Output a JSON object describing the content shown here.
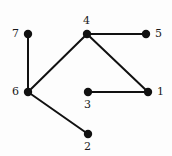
{
  "figure": {
    "kind": "undirected-graph-drawing",
    "width": 172,
    "height": 156,
    "background_color": "#fdfdfd",
    "edge_color": "#111111",
    "node_color": "#111111",
    "label_color": "#1a1a1a",
    "edge_width": 2,
    "node_radius": 4.2
  },
  "nodes": [
    {
      "id": "1",
      "label": "1",
      "x": 148,
      "y": 92,
      "label_x": 157,
      "label_y": 86,
      "label_anchor": "right"
    },
    {
      "id": "2",
      "label": "2",
      "x": 88,
      "y": 134,
      "label_x": 84,
      "label_y": 141,
      "label_anchor": "below"
    },
    {
      "id": "3",
      "label": "3",
      "x": 88,
      "y": 92,
      "label_x": 84,
      "label_y": 99,
      "label_anchor": "below"
    },
    {
      "id": "4",
      "label": "4",
      "x": 87,
      "y": 34,
      "label_x": 83,
      "label_y": 15,
      "label_anchor": "above"
    },
    {
      "id": "5",
      "label": "5",
      "x": 146,
      "y": 34,
      "label_x": 155,
      "label_y": 28,
      "label_anchor": "right"
    },
    {
      "id": "6",
      "label": "6",
      "x": 28,
      "y": 92,
      "label_x": 12,
      "label_y": 86,
      "label_anchor": "left"
    },
    {
      "id": "7",
      "label": "7",
      "x": 28,
      "y": 34,
      "label_x": 12,
      "label_y": 28,
      "label_anchor": "left"
    }
  ],
  "edges": [
    {
      "id": "edge-7-6",
      "source": "7",
      "target": "6"
    },
    {
      "id": "edge-6-4",
      "source": "6",
      "target": "4"
    },
    {
      "id": "edge-6-2",
      "source": "6",
      "target": "2"
    },
    {
      "id": "edge-4-5",
      "source": "4",
      "target": "5"
    },
    {
      "id": "edge-4-1",
      "source": "4",
      "target": "1"
    },
    {
      "id": "edge-3-1",
      "source": "3",
      "target": "1"
    }
  ]
}
